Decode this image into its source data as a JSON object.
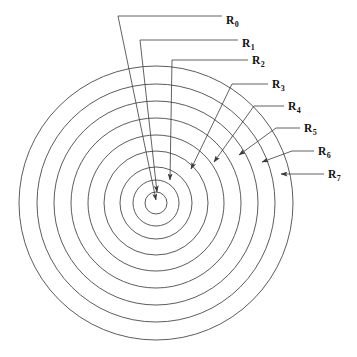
{
  "figure": {
    "background_color": "#ffffff",
    "stroke_color": "#4a4a4a",
    "label_color": "#111111",
    "center": {
      "x": 156,
      "y": 203
    },
    "labels": [
      {
        "id": "R0",
        "base": "R",
        "subscript": "0",
        "text": "R0",
        "text_x": 226,
        "text_y": 24,
        "radius": 0,
        "leader": "M 118,16 L 222,16",
        "pointer": "M 118,16 L 156,200",
        "arrow": {
          "x": 156,
          "y": 201,
          "angle": 101
        }
      },
      {
        "id": "R1",
        "base": "R",
        "subscript": "1",
        "text": "R1",
        "text_x": 242,
        "text_y": 47,
        "radius": 11,
        "leader": "M 140,40 L 238,40",
        "pointer": "M 140,40 L 157,192",
        "arrow": {
          "x": 157,
          "y": 193,
          "angle": 96
        }
      },
      {
        "id": "R2",
        "base": "R",
        "subscript": "2",
        "text": "R2",
        "text_x": 252,
        "text_y": 64,
        "radius": 23,
        "leader": "M 172,60 L 248,60",
        "pointer": "M 172,60 L 170,180",
        "arrow": {
          "x": 170,
          "y": 181,
          "angle": 91
        }
      },
      {
        "id": "R3",
        "base": "R",
        "subscript": "3",
        "text": "R3",
        "text_x": 272,
        "text_y": 88,
        "radius": 36,
        "leader": "M 232,84 L 268,84",
        "pointer": "M 232,84 L 191,169",
        "arrow": {
          "x": 190,
          "y": 170,
          "angle": 116
        }
      },
      {
        "id": "R4",
        "base": "R",
        "subscript": "4",
        "text": "R4",
        "text_x": 288,
        "text_y": 110,
        "radius": 52,
        "leader": "M 254,106 L 284,106",
        "pointer": "M 254,106 L 214,162",
        "arrow": {
          "x": 213,
          "y": 163,
          "angle": 125
        }
      },
      {
        "id": "R5",
        "base": "R",
        "subscript": "5",
        "text": "R5",
        "text_x": 304,
        "text_y": 132,
        "radius": 68,
        "leader": "M 276,128 L 300,128",
        "pointer": "M 276,128 L 239,155",
        "arrow": {
          "x": 238,
          "y": 156,
          "angle": 144
        }
      },
      {
        "id": "R6",
        "base": "R",
        "subscript": "6",
        "text": "R6",
        "text_x": 318,
        "text_y": 155,
        "radius": 85,
        "leader": "M 292,151 L 314,151",
        "pointer": "M 292,151 L 262,162",
        "arrow": {
          "x": 261,
          "y": 163,
          "angle": 160
        }
      },
      {
        "id": "R7",
        "base": "R",
        "subscript": "7",
        "text": "R7",
        "text_x": 328,
        "text_y": 178,
        "radius": 102,
        "leader": "M 306,174 L 324,174",
        "pointer": "M 306,174 L 281,174",
        "arrow": {
          "x": 280,
          "y": 174,
          "angle": 180
        }
      }
    ],
    "rings": [
      {
        "name": "ring-0-inner",
        "radius": 11
      },
      {
        "name": "ring-1",
        "radius": 23
      },
      {
        "name": "ring-2",
        "radius": 36
      },
      {
        "name": "ring-3",
        "radius": 52
      },
      {
        "name": "ring-4",
        "radius": 68
      },
      {
        "name": "ring-5",
        "radius": 85
      },
      {
        "name": "ring-6",
        "radius": 102
      },
      {
        "name": "ring-7",
        "radius": 119
      },
      {
        "name": "ring-8-outer",
        "radius": 137
      }
    ]
  },
  "chart_data": {
    "type": "diagram",
    "subtype": "concentric-circles",
    "center": {
      "x": 156,
      "y": 203
    },
    "categories": [
      "R0",
      "R1",
      "R2",
      "R3",
      "R4",
      "R5",
      "R6",
      "R7"
    ],
    "values": [
      0,
      11,
      23,
      36,
      52,
      68,
      85,
      102
    ],
    "ring_radii_px": [
      11,
      23,
      36,
      52,
      68,
      85,
      102,
      119,
      137
    ],
    "ring_count": 9,
    "label_count": 8,
    "xlabel": "",
    "ylabel": "",
    "grid": false,
    "legend": "none",
    "annotations": [
      "R0 points to the center of the pattern",
      "R1 through R7 point to successive concentric circles",
      "Leader lines originate from horizontal tick segments on the right"
    ]
  }
}
